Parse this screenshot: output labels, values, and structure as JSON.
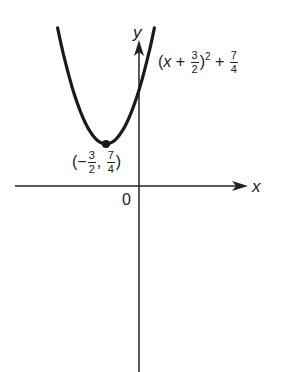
{
  "chart_data": {
    "type": "line",
    "title": "",
    "xlabel": "x",
    "ylabel": "y",
    "function": "(x + 3/2)^2 + 7/4",
    "vertex": {
      "x": -1.5,
      "y": 1.75,
      "label": "(-3/2, 7/4)"
    },
    "y_intercept": 4,
    "origin_label": "0",
    "x_range_plotted": [
      -3.7,
      0.7
    ],
    "grid": false,
    "line_color": "#1a1a1a"
  },
  "labels": {
    "y_axis": "y",
    "x_axis": "x",
    "origin": "0",
    "curve_open": "(",
    "curve_x": "x",
    "curve_plus1": "+",
    "curve_frac1_num": "3",
    "curve_frac1_den": "2",
    "curve_close": ")",
    "curve_exp": "2",
    "curve_plus2": "+",
    "curve_frac2_num": "7",
    "curve_frac2_den": "4",
    "vertex_open": "(−",
    "vertex_fx_num": "3",
    "vertex_fx_den": "2",
    "vertex_comma": ",",
    "vertex_fy_num": "7",
    "vertex_fy_den": "4",
    "vertex_close": ")"
  }
}
